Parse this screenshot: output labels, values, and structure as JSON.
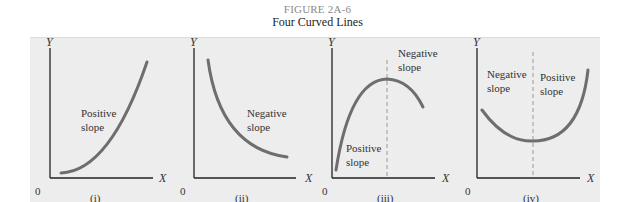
{
  "figure": {
    "label": "FIGURE 2A-6",
    "title": "Four Curved Lines"
  },
  "colors": {
    "panel_background": "#ededed",
    "curve": "#6e6e6e",
    "axis": "#222222",
    "dashed_divider": "#9a9a9a"
  },
  "panels": [
    {
      "caption": "(i)",
      "y_label": "Y",
      "x_label": "X",
      "origin": "0",
      "annotations": [
        {
          "line1": "Positive",
          "line2": "slope"
        }
      ]
    },
    {
      "caption": "(ii)",
      "y_label": "Y",
      "x_label": "X",
      "origin": "0",
      "annotations": [
        {
          "line1": "Negative",
          "line2": "slope"
        }
      ]
    },
    {
      "caption": "(iii)",
      "y_label": "Y",
      "x_label": "X",
      "origin": "0",
      "annotations": [
        {
          "line1": "Negative",
          "line2": "slope"
        },
        {
          "line1": "Positive",
          "line2": "slope"
        }
      ]
    },
    {
      "caption": "(iv)",
      "y_label": "Y",
      "x_label": "X",
      "origin": "0",
      "annotations": [
        {
          "line1": "Negative",
          "line2": "slope"
        },
        {
          "line1": "Positive",
          "line2": "slope"
        }
      ]
    }
  ]
}
